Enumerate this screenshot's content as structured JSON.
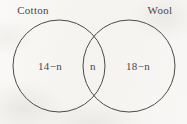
{
  "diagram": {
    "type": "venn-two-set",
    "background_color": "#f7f6f4",
    "stroke_color": "#4d4b49",
    "text_color": "#4a4846",
    "sets": [
      {
        "id": "cotton",
        "title": "Cotton",
        "cx": 59,
        "cy": 66,
        "r": 46
      },
      {
        "id": "wool",
        "title": "Wool",
        "cx": 129,
        "cy": 66,
        "r": 46
      }
    ],
    "regions": [
      {
        "id": "cotton-only",
        "label": "14−n"
      },
      {
        "id": "intersection",
        "label": "n"
      },
      {
        "id": "wool-only",
        "label": "18−n"
      }
    ]
  }
}
